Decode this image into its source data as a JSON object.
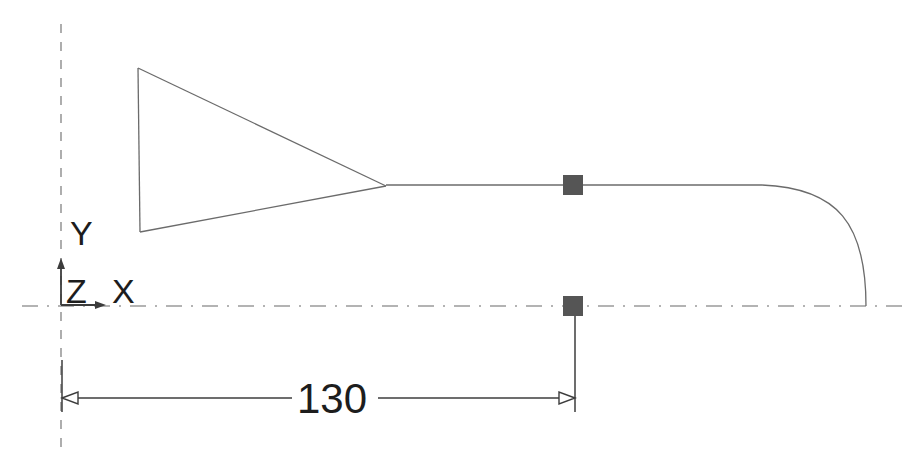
{
  "app": {
    "type": "cad-drawing-viewport",
    "background_color": "#ffffff",
    "width": 908,
    "height": 455
  },
  "colors": {
    "geometry_line": "#6b6b6b",
    "centerline": "#9a9a9a",
    "dimension_line": "#3c3c3c",
    "grip_marker": "#555555",
    "text": "#1d1d1d",
    "background": "#ffffff"
  },
  "axis_indicator": {
    "name": "ucs-icon",
    "origin": {
      "x": 61,
      "y": 305
    },
    "labels": {
      "y_label": "Y",
      "z_label": "Z",
      "x_label": "X"
    },
    "y_label_pos": {
      "x": 70,
      "y": 245
    },
    "z_label_pos": {
      "x": 66,
      "y": 303
    },
    "x_label_pos": {
      "x": 112,
      "y": 303
    },
    "x_arrow_end": {
      "x": 106,
      "y": 305
    },
    "y_arrow_end": {
      "x": 61,
      "y": 258
    }
  },
  "centerlines": {
    "vertical": {
      "name": "vertical-centerline",
      "x": 61,
      "y_start": 24,
      "y_end": 452,
      "style": "dashed"
    },
    "horizontal": {
      "name": "horizontal-axis-centerline",
      "y": 306,
      "x_start": 22,
      "x_end": 902,
      "style": "dash-dot"
    }
  },
  "profile": {
    "name": "revolved-profile-outline",
    "triangle": {
      "top_left": {
        "x": 138,
        "y": 68
      },
      "bottom_left": {
        "x": 140,
        "y": 232
      },
      "apex": {
        "x": 386,
        "y": 186
      }
    },
    "top_line": {
      "x_start": 386,
      "x_end": 762,
      "y": 185
    },
    "fillet_curve": {
      "start": {
        "x": 762,
        "y": 185
      },
      "control1": {
        "x": 838,
        "y": 188
      },
      "control2": {
        "x": 866,
        "y": 224
      },
      "end": {
        "x": 866,
        "y": 306
      }
    }
  },
  "grips": [
    {
      "name": "grip-marker-top",
      "x": 573,
      "y": 185,
      "size": 20,
      "state": "selected"
    },
    {
      "name": "grip-marker-bottom",
      "x": 573,
      "y": 306,
      "size": 20,
      "state": "selected"
    }
  ],
  "dimension": {
    "name": "linear-dimension-130",
    "value": "130",
    "text_pos": {
      "x": 332,
      "y": 399
    },
    "line_y": 398,
    "x_start": 62,
    "x_end": 575,
    "text_gap_left": 292,
    "text_gap_right": 378,
    "extension_left": {
      "x": 62,
      "y_start": 360,
      "y_end": 412
    },
    "extension_right": {
      "x": 575,
      "y_start": 300,
      "y_end": 412
    },
    "arrow_style": "hollow-open"
  }
}
